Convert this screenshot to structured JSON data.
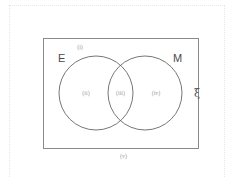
{
  "diagram": {
    "type": "venn",
    "universe": {
      "symbol": "ξ",
      "stroke": "#8a8a8a"
    },
    "sets": [
      {
        "name": "E",
        "stroke": "#666666"
      },
      {
        "name": "M",
        "stroke": "#666666"
      }
    ],
    "regions": [
      {
        "id": "i",
        "label": "(i)",
        "description": "inside universe, outside both circles (top)"
      },
      {
        "id": "ii",
        "label": "(ii)",
        "description": "E only"
      },
      {
        "id": "iii",
        "label": "(iii)",
        "description": "E and M intersection"
      },
      {
        "id": "iv",
        "label": "(iv)",
        "description": "M only"
      },
      {
        "id": "v",
        "label": "(v)",
        "description": "below universe rectangle"
      }
    ]
  }
}
